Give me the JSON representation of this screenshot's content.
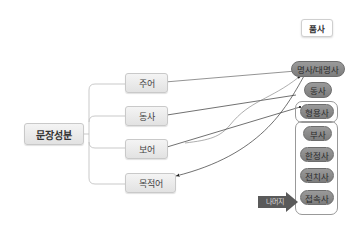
{
  "diagram": {
    "root": {
      "label": "문장성분"
    },
    "sentence_components": [
      {
        "id": "subject",
        "label": "주어"
      },
      {
        "id": "predicate",
        "label": "동사"
      },
      {
        "id": "complement",
        "label": "보어"
      },
      {
        "id": "object",
        "label": "목적어"
      }
    ],
    "parts_of_speech_title": "품사",
    "parts_of_speech": [
      {
        "id": "noun",
        "label": "명사/대명사"
      },
      {
        "id": "verb",
        "label": "동사"
      },
      {
        "id": "adjective",
        "label": "형용사"
      },
      {
        "id": "adverb",
        "label": "부사"
      },
      {
        "id": "determiner",
        "label": "한정사"
      },
      {
        "id": "preposition",
        "label": "전치사"
      },
      {
        "id": "conjunction",
        "label": "접속사"
      }
    ],
    "callout_label": "나머지",
    "edges": [
      {
        "from": "noun",
        "to": "subject"
      },
      {
        "from": "verb",
        "to": "predicate"
      },
      {
        "from": "noun",
        "to": "complement"
      },
      {
        "from": "adjective",
        "to": "complement"
      },
      {
        "from": "noun",
        "to": "object"
      }
    ],
    "colors": {
      "light_node": "#e8e8e8",
      "pos_pill": "#8a8a8a",
      "callout": "#5a5a5a",
      "line": "#444444",
      "tree_line": "#bbbbbb"
    }
  }
}
